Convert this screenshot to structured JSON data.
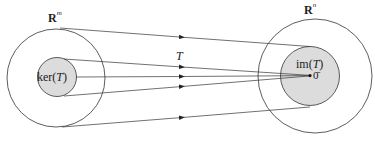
{
  "diagram": {
    "domain_space": {
      "label": "R",
      "superscript": "m"
    },
    "codomain_space": {
      "label": "R",
      "superscript": "n"
    },
    "kernel_label": "ker(",
    "kernel_var": "T",
    "kernel_close": ")",
    "image_label": "im(",
    "image_var": "T",
    "image_close": ")",
    "transformation_label": "T",
    "zero_vector_label": "0̄",
    "colors": {
      "stroke": "#333333",
      "subspace_fill": "#dcdcdc",
      "background": "#ffffff"
    }
  }
}
